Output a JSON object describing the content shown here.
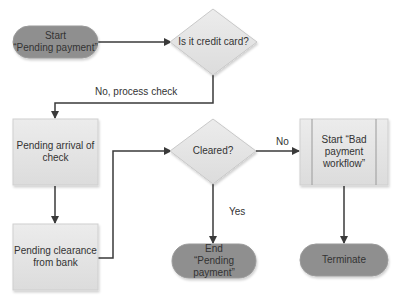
{
  "diagram": {
    "type": "flowchart",
    "nodes": [
      {
        "id": "start",
        "shape": "terminator",
        "lines": [
          "Start",
          "“Pending payment”"
        ],
        "fill": "#8f8f8f"
      },
      {
        "id": "is_credit_card",
        "shape": "decision",
        "lines": [
          "Is it credit card?"
        ],
        "fill": "#e0e0e0"
      },
      {
        "id": "pending_arrival",
        "shape": "process",
        "lines": [
          "Pending arrival of",
          "check"
        ],
        "fill": "#e6e6e6"
      },
      {
        "id": "pending_clearance",
        "shape": "process",
        "lines": [
          "Pending clearance",
          "from bank"
        ],
        "fill": "#e6e6e6"
      },
      {
        "id": "cleared",
        "shape": "decision",
        "lines": [
          "Cleared?"
        ],
        "fill": "#e0e0e0"
      },
      {
        "id": "end",
        "shape": "terminator",
        "lines": [
          "End",
          "“Pending payment”"
        ],
        "fill": "#8f8f8f"
      },
      {
        "id": "bad_payment",
        "shape": "predefined-process",
        "lines": [
          "Start “Bad",
          "payment",
          "workflow”"
        ],
        "fill": "#e6e6e6"
      },
      {
        "id": "terminate",
        "shape": "terminator",
        "lines": [
          "Terminate"
        ],
        "fill": "#8f8f8f"
      }
    ],
    "edges": [
      {
        "from": "start",
        "to": "is_credit_card",
        "label": ""
      },
      {
        "from": "is_credit_card",
        "to": "pending_arrival",
        "label": "No, process check"
      },
      {
        "from": "pending_arrival",
        "to": "pending_clearance",
        "label": ""
      },
      {
        "from": "pending_clearance",
        "to": "cleared",
        "label": ""
      },
      {
        "from": "cleared",
        "to": "end",
        "label": "Yes"
      },
      {
        "from": "cleared",
        "to": "bad_payment",
        "label": "No"
      },
      {
        "from": "bad_payment",
        "to": "terminate",
        "label": ""
      }
    ]
  },
  "labels": {
    "start_l1": "Start",
    "start_l2": "“Pending payment”",
    "q1": "Is it credit card?",
    "box1_l1": "Pending arrival of",
    "box1_l2": "check",
    "box2_l1": "Pending clearance",
    "box2_l2": "from bank",
    "q2": "Cleared?",
    "end_l1": "End",
    "end_l2": "“Pending payment”",
    "bad_l1": "Start “Bad",
    "bad_l2": "payment",
    "bad_l3": "workflow”",
    "terminate": "Terminate",
    "edge_no_check": "No, process check",
    "edge_yes": "Yes",
    "edge_no": "No"
  },
  "colors": {
    "terminator": "#8f8f8f",
    "process": "#e6e6e6",
    "decision": "#e0e0e0",
    "connector": "#3a3a3a"
  }
}
